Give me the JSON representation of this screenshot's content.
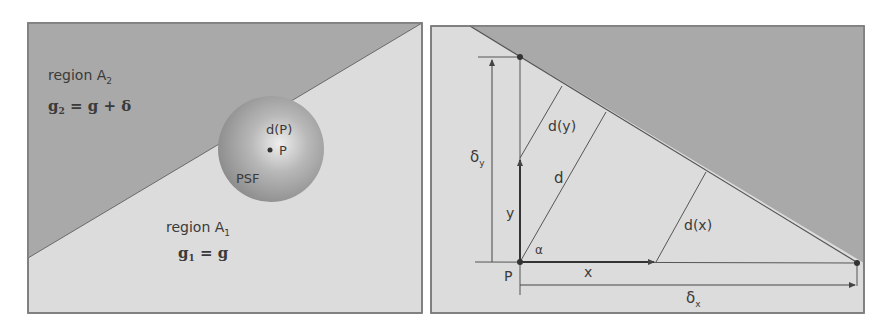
{
  "colors": {
    "dark_region": "#a9a9a9",
    "light_region": "#dcdcdc",
    "outline": "#7a7a7a",
    "line": "#555555",
    "text": "#3a3a3a"
  },
  "left_panel": {
    "region_a2": {
      "label": "region A",
      "label_sub": "2",
      "equation_lhs": "g",
      "equation_lhs_sub": "2",
      "equation_rhs": " = g + δ"
    },
    "region_a1": {
      "label": "region A",
      "label_sub": "1",
      "equation_lhs": "g",
      "equation_lhs_sub": "1",
      "equation_rhs": " = g"
    },
    "psf": {
      "label": "PSF",
      "distance_label": "d(P)",
      "point_label": "P"
    }
  },
  "right_panel": {
    "labels": {
      "delta_y": "δ",
      "delta_y_sub": "y",
      "delta_x": "δ",
      "delta_x_sub": "x",
      "d_y": "d(y)",
      "d": "d",
      "d_x": "d(x)",
      "y": "y",
      "x": "x",
      "alpha": "α",
      "p": "P"
    }
  }
}
